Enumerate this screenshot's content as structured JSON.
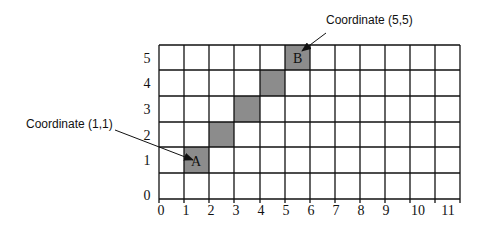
{
  "diagram": {
    "grid": {
      "columns": 11,
      "rows": 6,
      "line_color": "#111111",
      "fill_color": "#8c8c8c"
    },
    "x_axis_labels": [
      "0",
      "1",
      "2",
      "3",
      "4",
      "5",
      "6",
      "7",
      "8",
      "9",
      "10",
      "11"
    ],
    "y_axis_labels": [
      "5",
      "4",
      "3",
      "2",
      "1",
      "0"
    ],
    "shaded_cells": [
      {
        "col": 1,
        "row": 1,
        "label": "A"
      },
      {
        "col": 2,
        "row": 2,
        "label": ""
      },
      {
        "col": 3,
        "row": 3,
        "label": ""
      },
      {
        "col": 4,
        "row": 4,
        "label": ""
      },
      {
        "col": 5,
        "row": 5,
        "label": "B"
      }
    ],
    "callouts": {
      "a": {
        "text": "Coordinate (1,1)"
      },
      "b": {
        "text": "Coordinate (5,5)"
      }
    },
    "cell_labels": {
      "a": "A",
      "b": "B"
    }
  }
}
